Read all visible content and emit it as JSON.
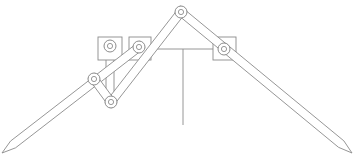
{
  "diagram": {
    "title": "",
    "type": "mechanical-linkage",
    "colors": {
      "line": "#8a8a8a",
      "background": "#ffffff",
      "fill": "#ffffff"
    },
    "blocks": [
      {
        "id": "left-block-1",
        "x": 98,
        "y": 37,
        "w": 24,
        "h": 23
      },
      {
        "id": "left-block-2",
        "x": 129,
        "y": 37,
        "w": 22,
        "h": 23
      },
      {
        "id": "right-block",
        "x": 213,
        "y": 37,
        "w": 23,
        "h": 23
      }
    ],
    "pivots": [
      {
        "id": "top-pivot",
        "x": 181,
        "y": 12
      },
      {
        "id": "block1-pivot",
        "x": 110,
        "y": 46
      },
      {
        "id": "block2-pivot",
        "x": 139,
        "y": 47
      },
      {
        "id": "right-block-pivot",
        "x": 224,
        "y": 49
      },
      {
        "id": "middle-left-pivot",
        "x": 94,
        "y": 79
      },
      {
        "id": "lower-pivot",
        "x": 111,
        "y": 102
      }
    ],
    "bars": [
      {
        "id": "left-long-arm",
        "from": [
          139,
          47
        ],
        "to": [
          2,
          153
        ],
        "pointed": true
      },
      {
        "id": "right-long-arm",
        "from": [
          181,
          12
        ],
        "to": [
          352,
          153
        ],
        "pointed": true
      },
      {
        "id": "left-inner-arm",
        "from": [
          181,
          12
        ],
        "to": [
          111,
          102
        ],
        "pointed": false
      },
      {
        "id": "short-link",
        "from": [
          94,
          79
        ],
        "to": [
          111,
          102
        ],
        "pointed": false
      }
    ],
    "lines": [
      {
        "id": "horizontal-beam",
        "from": [
          151,
          49
        ],
        "to": [
          213,
          49
        ]
      },
      {
        "id": "vertical-post",
        "from": [
          183,
          49
        ],
        "to": [
          183,
          125
        ]
      },
      {
        "id": "block1-rod-a",
        "from": [
          106,
          52
        ],
        "to": [
          106,
          90
        ]
      },
      {
        "id": "block1-rod-b",
        "from": [
          114,
          52
        ],
        "to": [
          114,
          95
        ]
      }
    ],
    "labels": []
  }
}
